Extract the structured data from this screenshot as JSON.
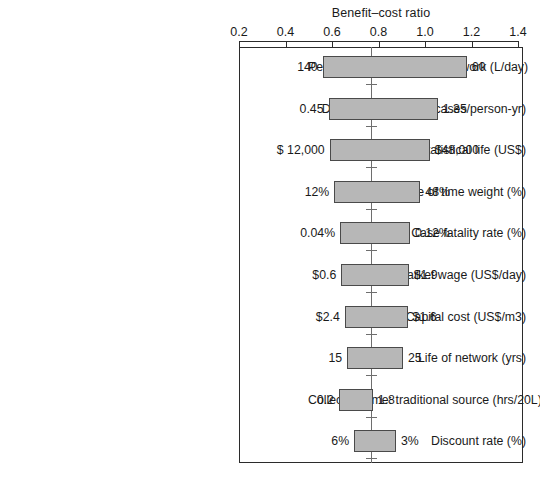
{
  "chart_data": {
    "type": "bar",
    "chart_style": "tornado-diagram",
    "title": "Benefit–cost ratio",
    "xlabel": "Benefit–cost ratio",
    "ylabel": "",
    "xlim": [
      0.2,
      1.4
    ],
    "xticks": [
      0.2,
      0.4,
      0.6,
      0.8,
      1.0,
      1.2,
      1.4
    ],
    "xtick_labels": [
      "0.2",
      "0.4",
      "0.6",
      "0.8",
      "1.0",
      "1.2",
      "1.4"
    ],
    "baseline": 0.77,
    "grid": false,
    "legend": "none",
    "categories": [
      "Per capita consumption–network (L/day)",
      "Diarrheal incidence (cases/person-yr)",
      "Value of a statistical life (US$)",
      "Value of time weight (%)",
      "Case fatality rate (%)",
      "Unskilled market wage (US$/day)",
      "Capital cost (US$/m3)",
      "Life of network (yrs)",
      "Collection time: traditional source (hrs/20L)",
      "Discount rate (%)"
    ],
    "bars": [
      {
        "label": "Per capita consumption–network (L/day)",
        "low_label": "140",
        "high_label": "60",
        "low_value": 0.56,
        "high_value": 1.18
      },
      {
        "label": "Diarrheal incidence (cases/person-yr)",
        "low_label": "0.45",
        "high_label": "1.35",
        "low_value": 0.585,
        "high_value": 1.055
      },
      {
        "label": "Value of a statistical life (US$)",
        "low_label": "$ 12,000",
        "high_label": "$48,000",
        "low_value": 0.59,
        "high_value": 1.02
      },
      {
        "label": "Value of time weight (%)",
        "low_label": "12%",
        "high_label": "48%",
        "low_value": 0.61,
        "high_value": 0.98
      },
      {
        "label": "Case fatality rate (%)",
        "low_label": "0.04%",
        "high_label": "0.12%",
        "low_value": 0.635,
        "high_value": 0.935
      },
      {
        "label": "Unskilled market wage (US$/day)",
        "low_label": "$0.6",
        "high_label": "$1.9",
        "low_value": 0.64,
        "high_value": 0.93
      },
      {
        "label": "Capital cost (US$/m3)",
        "low_label": "$2.4",
        "high_label": "$1.6",
        "low_value": 0.655,
        "high_value": 0.925
      },
      {
        "label": "Life of network (yrs)",
        "low_label": "15",
        "high_label": "25",
        "low_value": 0.665,
        "high_value": 0.905
      },
      {
        "label": "Collection time: traditional source (hrs/20L)",
        "low_label": "0.2",
        "high_label": "1.8",
        "low_value": 0.63,
        "high_value": 0.775
      },
      {
        "label": "Discount rate (%)",
        "low_label": "6%",
        "high_label": "3%",
        "low_value": 0.695,
        "high_value": 0.875
      }
    ]
  },
  "axis": {
    "title": "Benefit–cost ratio",
    "ticks": [
      "0.2",
      "0.4",
      "0.6",
      "0.8",
      "1.0",
      "1.2",
      "1.4"
    ]
  },
  "colors": {
    "bar_fill": "#b7b7b7",
    "bar_stroke": "#4a4a4a",
    "frame": "#2b2b2b",
    "baseline": "#6e6e6e",
    "text": "#1a1a1a",
    "background": "#ffffff"
  }
}
